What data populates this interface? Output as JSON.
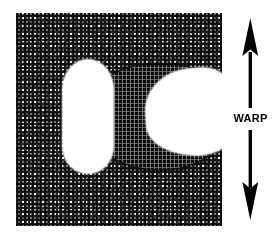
{
  "figure": {
    "name": "fabric-warp-direction-figure",
    "background_color": "#ffffff"
  },
  "swatch": {
    "name": "woven-fabric-swatch",
    "weave_type": "plain-weave",
    "texture_color": "#111111",
    "ground_color": "#ffffff"
  },
  "regions": {
    "stain": {
      "label": "dark-region",
      "color": "#0a0a0a"
    },
    "void_left": {
      "label": "left-void",
      "color": "#ffffff"
    },
    "void_right": {
      "label": "right-void",
      "color": "#ffffff"
    }
  },
  "annotation": {
    "warp_label": "WARP",
    "arrow_type": "double-headed-vertical",
    "arrow_color": "#000000"
  }
}
